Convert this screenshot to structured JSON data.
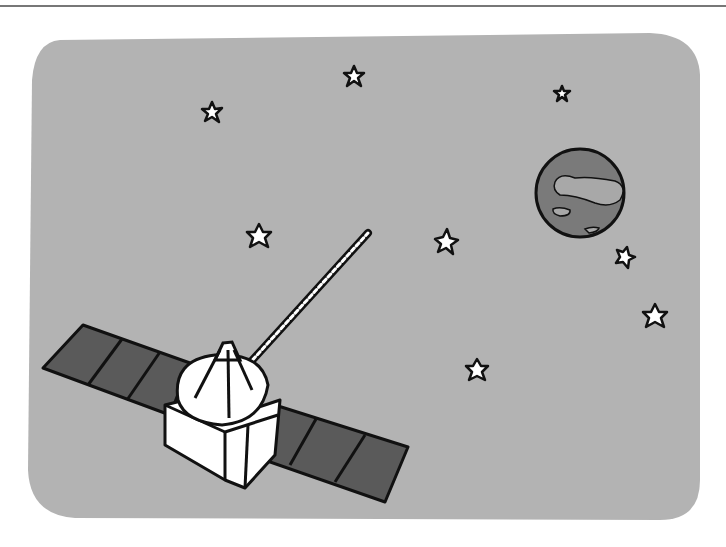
{
  "illustration": {
    "subject": "satellite in space with planet and stars",
    "colors": {
      "background": "#ffffff",
      "sky": "#b3b3b3",
      "panel": "#5a5a5a",
      "planet": "#7a7a7a",
      "planet_patch": "#a8a8a8",
      "body": "#ffffff",
      "outline": "#111111"
    },
    "stars": [
      {
        "x": 354,
        "y": 76,
        "r": 10
      },
      {
        "x": 212,
        "y": 112,
        "r": 10
      },
      {
        "x": 562,
        "y": 94,
        "r": 8
      },
      {
        "x": 259,
        "y": 236,
        "r": 12
      },
      {
        "x": 446,
        "y": 241,
        "r": 12
      },
      {
        "x": 625,
        "y": 257,
        "r": 10
      },
      {
        "x": 655,
        "y": 316,
        "r": 12
      },
      {
        "x": 477,
        "y": 370,
        "r": 11
      }
    ]
  }
}
